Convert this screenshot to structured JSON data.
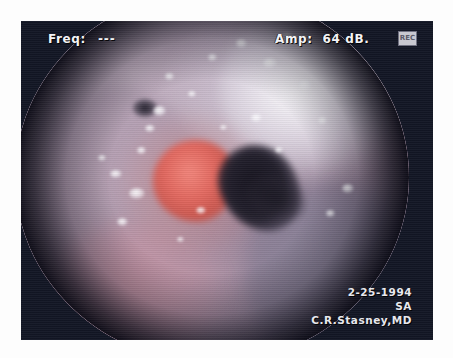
{
  "frame": {
    "background_color": "#121624",
    "page_background": "#fdfdfd"
  },
  "header": {
    "freq_label": "Freq:",
    "freq_value": "---",
    "amp_label": "Amp:",
    "amp_value": "64 dB.",
    "mode_badge_text": "REC"
  },
  "scope": {
    "field_shape": "circular-endoscopic-view",
    "tissue_colors": {
      "mucosa_mauve": "#a294a8",
      "mucosa_pink": "#c49eb0",
      "lesion_red": "#e2685f",
      "lesion_highlight": "#f2867c",
      "glottis_dark": "#14121c",
      "specular_white": "#ffffff"
    },
    "highlights": [
      {
        "left": 24,
        "top": 48,
        "w": 3.2,
        "h": 2.4
      },
      {
        "left": 29,
        "top": 53,
        "w": 4.0,
        "h": 3.0
      },
      {
        "left": 33,
        "top": 36,
        "w": 2.6,
        "h": 2.0
      },
      {
        "left": 35,
        "top": 31,
        "w": 3.4,
        "h": 2.6
      },
      {
        "left": 31,
        "top": 42,
        "w": 2.2,
        "h": 1.8
      },
      {
        "left": 26,
        "top": 61,
        "w": 2.8,
        "h": 2.2
      },
      {
        "left": 38,
        "top": 22,
        "w": 2.4,
        "h": 1.9
      },
      {
        "left": 44,
        "top": 27,
        "w": 2.0,
        "h": 1.6
      },
      {
        "left": 56,
        "top": 13,
        "w": 3.0,
        "h": 2.4
      },
      {
        "left": 63,
        "top": 18,
        "w": 3.6,
        "h": 2.8
      },
      {
        "left": 68,
        "top": 11,
        "w": 2.6,
        "h": 2.0
      },
      {
        "left": 72,
        "top": 24,
        "w": 3.2,
        "h": 2.5
      },
      {
        "left": 60,
        "top": 33,
        "w": 2.8,
        "h": 2.2
      },
      {
        "left": 77,
        "top": 34,
        "w": 2.2,
        "h": 1.8
      },
      {
        "left": 66,
        "top": 42,
        "w": 2.0,
        "h": 1.6
      },
      {
        "left": 49,
        "top": 17,
        "w": 2.2,
        "h": 1.7
      },
      {
        "left": 83,
        "top": 52,
        "w": 3.0,
        "h": 2.4
      },
      {
        "left": 79,
        "top": 59,
        "w": 2.2,
        "h": 1.8
      },
      {
        "left": 46,
        "top": 58,
        "w": 2.4,
        "h": 1.9
      },
      {
        "left": 41,
        "top": 66,
        "w": 2.0,
        "h": 1.6
      },
      {
        "left": 52,
        "top": 36,
        "w": 1.8,
        "h": 1.5
      },
      {
        "left": 21,
        "top": 44,
        "w": 2.0,
        "h": 1.6
      }
    ]
  },
  "footer": {
    "date": "2-25-1994",
    "initials": "SA",
    "physician": "C.R.Stasney,MD"
  }
}
